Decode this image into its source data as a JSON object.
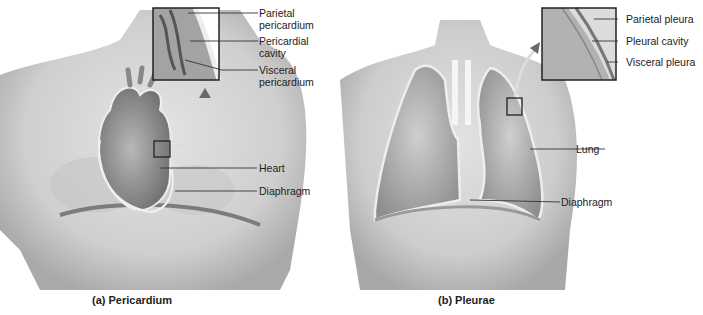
{
  "panels": [
    {
      "id": "a",
      "caption": "(a) Pericardium",
      "labels": {
        "parietal": [
          "Parietal",
          "pericardium"
        ],
        "cavity": [
          "Pericardial",
          "cavity"
        ],
        "visceral": [
          "Visceral",
          "pericardium"
        ],
        "heart": "Heart",
        "diaphragm": "Diaphragm"
      }
    },
    {
      "id": "b",
      "caption": "(b) Pleurae",
      "labels": {
        "parietal": "Parietal pleura",
        "cavity": "Pleural cavity",
        "visceral": "Visceral pleura",
        "lung": "Lung",
        "diaphragm": "Diaphragm"
      }
    }
  ],
  "colors": {
    "skin": "#d9d9d9",
    "skin_shadow": "#b5b5b5",
    "organ": "#9a9a9a",
    "membrane": "#eeeeee",
    "leader_line": "#333333"
  }
}
